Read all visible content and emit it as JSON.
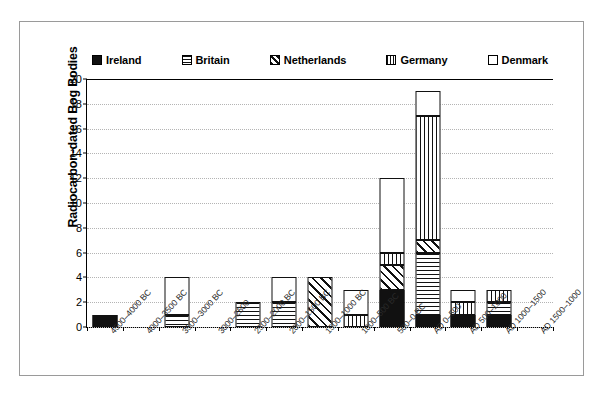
{
  "chart_data": {
    "type": "bar",
    "stacked": true,
    "title": "",
    "xlabel": "",
    "ylabel": "Radiocarbon-dated Bog Bodies",
    "ylim": [
      0,
      20
    ],
    "ytick_step": 2,
    "yticks": [
      "0",
      "2",
      "4",
      "6",
      "8",
      "10",
      "12",
      "14",
      "16",
      "18",
      "20"
    ],
    "grid": "horizontal-dotted",
    "legend_position": "top-center",
    "categories": [
      "4500–4000 BC",
      "4000–3500 BC",
      "3500–3000 BC",
      "3000–2500",
      "2500–2000 BC",
      "2000–1500 BC",
      "1500–1000 BC",
      "1000–500 BC",
      "500–0 BC",
      "AD 0–500",
      "AD 500–1000",
      "AD 1000–1500",
      "AD 1500–1000"
    ],
    "series": [
      {
        "name": "Ireland",
        "pattern": "solid-black",
        "values": [
          1,
          0,
          0,
          0,
          0,
          0,
          0,
          0,
          3,
          1,
          1,
          1,
          0
        ]
      },
      {
        "name": "Britain",
        "pattern": "horizontal-lines",
        "values": [
          0,
          0,
          1,
          0,
          2,
          2,
          0,
          0,
          0,
          5,
          0,
          1,
          0
        ]
      },
      {
        "name": "Netherlands",
        "pattern": "diagonal-hatch",
        "values": [
          0,
          0,
          0,
          0,
          0,
          0,
          4,
          0,
          2,
          1,
          0,
          0,
          0
        ]
      },
      {
        "name": "Germany",
        "pattern": "vertical-lines",
        "values": [
          0,
          0,
          0,
          0,
          0,
          0,
          0,
          1,
          1,
          10,
          1,
          1,
          0
        ]
      },
      {
        "name": "Denmark",
        "pattern": "empty-white",
        "values": [
          0,
          0,
          3,
          0,
          0,
          2,
          0,
          2,
          6,
          2,
          1,
          0,
          0
        ]
      }
    ],
    "totals": [
      1,
      0,
      4,
      0,
      2,
      4,
      4,
      3,
      12,
      19,
      3,
      3,
      0
    ]
  },
  "legend": {
    "items": [
      {
        "label": "Ireland",
        "pattern": "solid-black"
      },
      {
        "label": "Britain",
        "pattern": "horizontal-lines"
      },
      {
        "label": "Netherlands",
        "pattern": "diagonal-hatch"
      },
      {
        "label": "Germany",
        "pattern": "vertical-lines"
      },
      {
        "label": "Denmark",
        "pattern": "empty-white"
      }
    ]
  },
  "colors": {
    "ink": "#111111",
    "paper": "#ffffff",
    "gridline": "#b4b4b4",
    "frame": "#9a9a9a",
    "label": "#2a2a2a"
  }
}
